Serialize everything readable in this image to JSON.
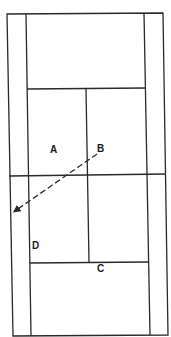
{
  "diagram": {
    "type": "tennis-court-top-view",
    "line_color": "#2a2a2a",
    "background": "#ffffff",
    "labels": [
      {
        "id": "A",
        "text": "A",
        "x": 54,
        "y": 153
      },
      {
        "id": "B",
        "text": "B",
        "x": 101,
        "y": 152
      },
      {
        "id": "C",
        "text": "C",
        "x": 101,
        "y": 272
      },
      {
        "id": "D",
        "text": "D",
        "x": 36,
        "y": 249
      }
    ],
    "arrow": {
      "style": "dashed",
      "from": "B",
      "to": "left-sideline",
      "x1": 97,
      "y1": 154,
      "x2": 13,
      "y2": 212
    }
  }
}
